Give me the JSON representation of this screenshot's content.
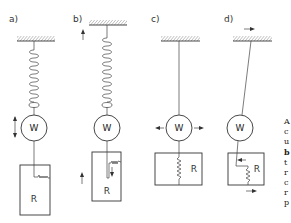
{
  "figure": {
    "panels": [
      {
        "id": "a",
        "label": "a)",
        "weight_label": "W",
        "reservoir_label": "R",
        "support": "spring",
        "motion": "vertical oscillation of weight"
      },
      {
        "id": "b",
        "label": "b)",
        "weight_label": "W",
        "reservoir_label": "R",
        "support": "spring",
        "motion": "vertical movement of support and reservoir"
      },
      {
        "id": "c",
        "label": "c)",
        "weight_label": "W",
        "reservoir_label": "R",
        "support": "string",
        "motion": "horizontal oscillation of weight"
      },
      {
        "id": "d",
        "label": "d)",
        "weight_label": "W",
        "reservoir_label": "R",
        "support": "string",
        "motion": "horizontal movement of support and reservoir"
      }
    ],
    "caption_fragment_chars": [
      "A",
      "c",
      "u",
      "b",
      "t",
      "r",
      "c",
      "r",
      "p"
    ]
  }
}
